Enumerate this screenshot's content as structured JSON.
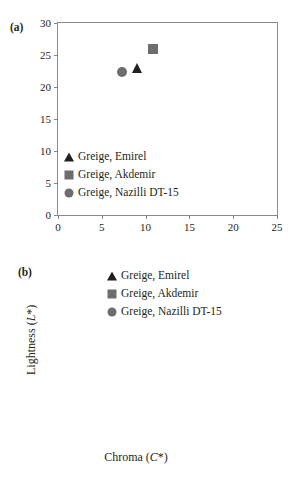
{
  "figure": {
    "panel_a_label": "(a)",
    "panel_b_label": "(b)"
  },
  "series_names": {
    "emirel": "Greige, Emirel",
    "akdemir": "Greige, Akdemir",
    "nazilli": "Greige, Nazilli DT-15"
  },
  "colors": {
    "emirel_marker": "#231f20",
    "akdemir_marker": "#6d6d6d",
    "nazilli_marker": "#6d6d6d",
    "axis": "#8a8a8a",
    "text": "#231f20",
    "background": "#ffffff"
  },
  "chart_data": [
    {
      "id": "panel-a",
      "type": "scatter",
      "title": "(a)",
      "xlabel": "a*",
      "ylabel": "b*",
      "xlim": [
        0,
        25
      ],
      "ylim": [
        0,
        30
      ],
      "xticks": [
        0,
        5,
        10,
        15,
        20,
        25
      ],
      "yticks": [
        0,
        5,
        10,
        15,
        20,
        25,
        30
      ],
      "xtick_labels": [
        "0",
        "5",
        "10",
        "15",
        "20",
        "25"
      ],
      "ytick_labels": [
        "0",
        "5",
        "10",
        "15",
        "20",
        "25",
        "30"
      ],
      "grid": false,
      "legend_position": "lower-left-inside",
      "series": [
        {
          "name": "Greige, Emirel",
          "marker": "triangle",
          "color": "#231f20",
          "points": [
            {
              "x": 9.0,
              "y": 23.0
            }
          ]
        },
        {
          "name": "Greige, Akdemir",
          "marker": "square",
          "color": "#6d6d6d",
          "points": [
            {
              "x": 10.8,
              "y": 26.0
            }
          ]
        },
        {
          "name": "Greige, Nazilli DT-15",
          "marker": "circle",
          "color": "#6d6d6d",
          "points": [
            {
              "x": 7.3,
              "y": 22.4
            }
          ]
        }
      ]
    },
    {
      "id": "panel-b",
      "type": "scatter",
      "title": "(b)",
      "xlabel": "Chroma (C*)",
      "ylabel": "Lightness (L*)",
      "xlim": [
        20,
        40
      ],
      "ylim": [
        50,
        90
      ],
      "xticks": [
        20,
        25,
        30,
        35,
        40
      ],
      "yticks": [
        50,
        60,
        70,
        80,
        90
      ],
      "xtick_labels": [
        "20",
        "25",
        "30",
        "35",
        "40"
      ],
      "ytick_labels": [
        "50",
        "60",
        "70",
        "80",
        "90"
      ],
      "grid": false,
      "legend_position": "upper-center-inside",
      "series": [
        {
          "name": "Greige, Emirel",
          "marker": "triangle",
          "color": "#231f20",
          "points": [
            {
              "x": 24.7,
              "y": 68.3
            }
          ]
        },
        {
          "name": "Greige, Akdemir",
          "marker": "square",
          "color": "#6d6d6d",
          "points": [
            {
              "x": 28.3,
              "y": 61.8
            }
          ]
        },
        {
          "name": "Greige, Nazilli DT-15",
          "marker": "circle",
          "color": "#6d6d6d",
          "points": [
            {
              "x": 23.5,
              "y": 73.0
            }
          ]
        }
      ]
    }
  ]
}
